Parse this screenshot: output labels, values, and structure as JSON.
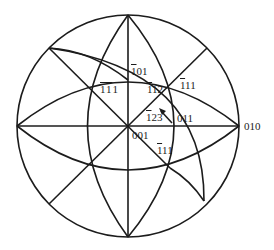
{
  "diagram": {
    "type": "stereographic-projection",
    "line_color": "#1c1c1c",
    "background": "#ffffff",
    "primitive_circle": {
      "cx": 128,
      "cy": 126,
      "r": 111
    },
    "poles": [
      {
        "id": "p001",
        "label_bar": "",
        "label_rest": "001",
        "x": 128,
        "y": 126,
        "lx": 132,
        "ly": 130
      },
      {
        "id": "p010",
        "label_bar": "",
        "label_rest": "010",
        "x": 239,
        "y": 126,
        "lx": 244,
        "ly": 122
      },
      {
        "id": "p011",
        "label_bar": "",
        "label_rest": "011",
        "x": 175,
        "y": 126,
        "lx": 177,
        "ly": 112
      },
      {
        "id": "pm101",
        "label_bar": "1",
        "label_rest": "01",
        "x": 128,
        "y": 80,
        "lx": 132,
        "ly": 66
      },
      {
        "id": "pm1m11",
        "label_bar": "11",
        "label_rest": "1",
        "x": 88,
        "y": 85,
        "lx": 101,
        "ly": 83
      },
      {
        "id": "pm112",
        "label_bar": "1",
        "label_rest": "12",
        "x": 150,
        "y": 98,
        "lx": 148,
        "ly": 84
      },
      {
        "id": "pm111",
        "label_bar": "1",
        "label_rest": "11",
        "x": 170,
        "y": 87,
        "lx": 180,
        "ly": 80
      },
      {
        "id": "pm123",
        "label_bar": "1",
        "label_rest": "23",
        "x": 160,
        "y": 115,
        "lx": 146,
        "ly": 111
      },
      {
        "id": "pm1m1m1",
        "label_bar": "1",
        "label_rest": "11",
        "x": 167,
        "y": 167,
        "lx": 158,
        "ly": 145
      }
    ],
    "arrow": {
      "from": [
        172,
        122
      ],
      "to": [
        160,
        110
      ]
    }
  }
}
